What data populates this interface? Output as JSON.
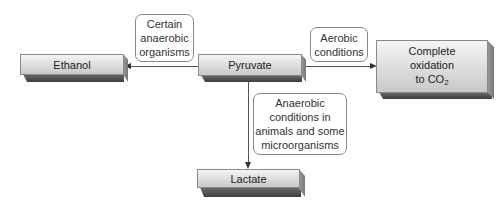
{
  "nodes": {
    "pyruvate": "Pyruvate",
    "ethanol": "Ethanol",
    "lactate": "Lactate",
    "oxidation": {
      "line1": "Complete",
      "line2": "oxidation",
      "line3_prefix": "to CO",
      "line3_sub": "2"
    }
  },
  "conditions": {
    "ethanol": {
      "line1": "Certain",
      "line2": "anaerobic",
      "line3": "organisms"
    },
    "oxidation": {
      "line1": "Aerobic",
      "line2": "conditions"
    },
    "lactate": {
      "line1": "Anaerobic",
      "line2": "conditions in",
      "line3": "animals and some",
      "line4": "microorganisms"
    }
  },
  "colors": {
    "face_light": "#f4f4f4",
    "face_dark": "#c9c9c9",
    "shadow": "#4a4a4a",
    "line": "#555555"
  }
}
